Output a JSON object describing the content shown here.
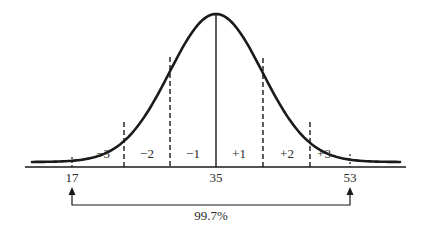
{
  "diagram": {
    "regions": [
      {
        "label": "−3",
        "x": 103
      },
      {
        "label": "−2",
        "x": 147
      },
      {
        "label": "−1",
        "x": 193
      },
      {
        "label": "+1",
        "x": 239
      },
      {
        "label": "+2",
        "x": 287
      },
      {
        "label": "+3",
        "x": 324
      }
    ],
    "axis_ticks": [
      {
        "label": "17",
        "x": 72
      },
      {
        "label": "35",
        "x": 216
      },
      {
        "label": "53",
        "x": 350
      }
    ],
    "range_label": "99.7%",
    "colors": {
      "stroke": "#1a1a1a",
      "text": "#2a2a2a",
      "background": "#ffffff"
    }
  },
  "chart_data": {
    "type": "line",
    "mean": 35,
    "sd": 6,
    "x": [
      17,
      35,
      53
    ],
    "xlabel": "",
    "ylabel": "",
    "region_labels": [
      "−3",
      "−2",
      "−1",
      "+1",
      "+2",
      "+3"
    ],
    "annotations": [
      "99.7% between 17 and 53"
    ]
  }
}
